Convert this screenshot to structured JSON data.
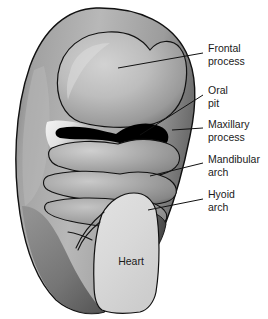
{
  "figure": {
    "background_color": "#ffffff",
    "outline_color": "#111111",
    "body_color_mid": "#9a9a9a",
    "body_color_light": "#cfcfcf",
    "body_color_dark": "#5d5d5d",
    "oral_pit_color": "#000000",
    "heart_color": "#d9d9d9",
    "text_color": "#1a1a1a"
  },
  "labels": [
    {
      "id": "frontal-process",
      "line1": "Frontal",
      "line2": "process",
      "x": 208,
      "y": 44
    },
    {
      "id": "oral-pit",
      "line1": "Oral",
      "line2": "pit",
      "x": 208,
      "y": 86
    },
    {
      "id": "maxillary-process",
      "line1": "Maxillary",
      "line2": "process",
      "x": 208,
      "y": 120
    },
    {
      "id": "mandibular-arch",
      "line1": "Mandibular",
      "line2": "arch",
      "x": 208,
      "y": 155
    },
    {
      "id": "hyoid-arch",
      "line1": "Hyoid",
      "line2": "arch",
      "x": 208,
      "y": 190
    }
  ],
  "organs": [
    {
      "id": "heart",
      "label": "Heart",
      "x": 131,
      "y": 262
    }
  ],
  "structures": [
    {
      "id": "embryo-body",
      "name": "embryo body"
    },
    {
      "id": "frontal-process-lobe",
      "name": "frontal process lobe"
    },
    {
      "id": "oral-pit-region",
      "name": "oral pit"
    },
    {
      "id": "maxillary-process-lobe",
      "name": "maxillary process"
    },
    {
      "id": "mandibular-arch-band",
      "name": "mandibular arch"
    },
    {
      "id": "hyoid-arch-band",
      "name": "hyoid arch"
    },
    {
      "id": "heart-bulge",
      "name": "heart bulge"
    }
  ]
}
